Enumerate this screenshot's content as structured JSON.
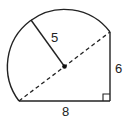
{
  "diagram": {
    "labels": {
      "radius": "5",
      "vertical_leg": "6",
      "horizontal_leg": "8"
    },
    "elements": {
      "semicircle": {
        "radius": 5
      },
      "triangle": {
        "legs": [
          6,
          8
        ],
        "hypotenuse": 10,
        "right_angle_marker": true
      },
      "diameter_line_style": "dashed",
      "center_point": true
    },
    "colors": {
      "stroke": "#222222",
      "background": "#ffffff"
    }
  }
}
